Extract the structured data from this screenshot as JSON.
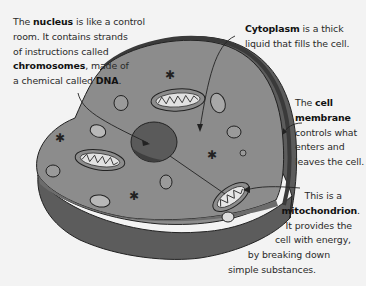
{
  "diagram": {
    "colors": {
      "background": "#f3f3f3",
      "cytoplasm_top": "#8a8a8a",
      "cell_side": "#5c5c5c",
      "membrane": "#3f3f3f",
      "nucleus": "#555555",
      "organelle": "#9a9a9a",
      "mitochondrion_inner": "#e6e6e6",
      "outline": "#222222"
    },
    "labels": {
      "nucleus": {
        "lines": [
          {
            "pre": "The ",
            "bold": "nucleus",
            "post": " is like a control"
          },
          {
            "pre": "room. It contains strands",
            "bold": "",
            "post": ""
          },
          {
            "pre": "of instructions called",
            "bold": "",
            "post": ""
          },
          {
            "pre": "",
            "bold": "chromosomes",
            "post": ", made of"
          },
          {
            "pre": "a chemical called ",
            "bold": "DNA",
            "post": "."
          }
        ]
      },
      "cytoplasm": {
        "lines": [
          {
            "pre": "",
            "bold": "Cytoplasm",
            "post": " is a thick"
          },
          {
            "pre": "liquid that fills the cell.",
            "bold": "",
            "post": ""
          }
        ]
      },
      "cell_membrane": {
        "lines": [
          {
            "pre": "The ",
            "bold": "cell",
            "post": ""
          },
          {
            "pre": "",
            "bold": "membrane",
            "post": ""
          },
          {
            "pre": "controls what",
            "bold": "",
            "post": ""
          },
          {
            "pre": "enters and",
            "bold": "",
            "post": ""
          },
          {
            "pre": "leaves the cell.",
            "bold": "",
            "post": ""
          }
        ]
      },
      "mitochondrion": {
        "lines": [
          {
            "pre": "This is a",
            "bold": "",
            "post": ""
          },
          {
            "pre": "",
            "bold": "mitochondrion",
            "post": "."
          },
          {
            "pre": "It provides the",
            "bold": "",
            "post": ""
          },
          {
            "pre": "cell with energy,",
            "bold": "",
            "post": ""
          },
          {
            "pre": "by breaking down",
            "bold": "",
            "post": ""
          },
          {
            "pre": "simple substances.",
            "bold": "",
            "post": ""
          }
        ]
      }
    }
  }
}
